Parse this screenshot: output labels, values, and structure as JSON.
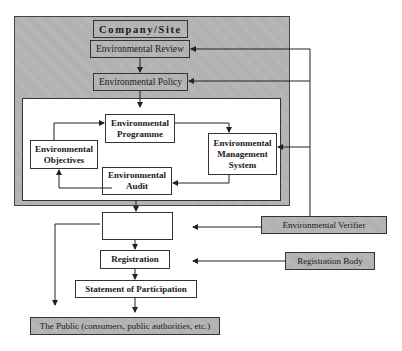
{
  "diagram": {
    "container": {
      "label": "Company/Site",
      "review": "Environmental Review",
      "policy": "Environmental Policy",
      "cycle": {
        "programme": "Environmental Programme",
        "objectives": "Environmental Objectives",
        "ems": "Environmental Management System",
        "audit": "Environmental Audit"
      }
    },
    "statement": "Environmental Statement",
    "registration": "Registration",
    "participation": "Statement of Participation",
    "public": "The Public (consumers, public authorities, etc.)",
    "external": {
      "verifier": "Environmental Verifier",
      "registration_body": "Registration Body"
    },
    "colors": {
      "shaded_box": "#b9b9b9",
      "line": "#222222",
      "background": "#ffffff"
    }
  }
}
